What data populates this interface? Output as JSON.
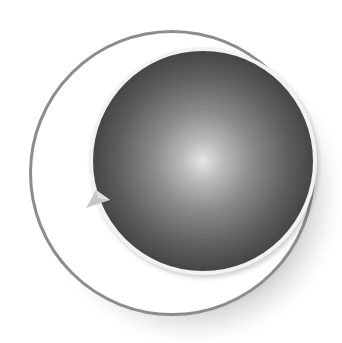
{
  "image": {
    "description": "Sphere inside a white ring icon",
    "colors": {
      "background": "#ffffff",
      "ring_fill": "#ffffff",
      "ring_outline": "#8c8c8c",
      "sphere_highlight": "#e6e6e6",
      "sphere_edge": "#262626",
      "shadow": "#000000",
      "pointer": "#c8c8c8"
    },
    "icons": {
      "shadow": "drop-shadow",
      "outer": "ring-disk-icon",
      "inner": "sphere-icon",
      "pointer": "arrow-pointer-icon"
    }
  }
}
